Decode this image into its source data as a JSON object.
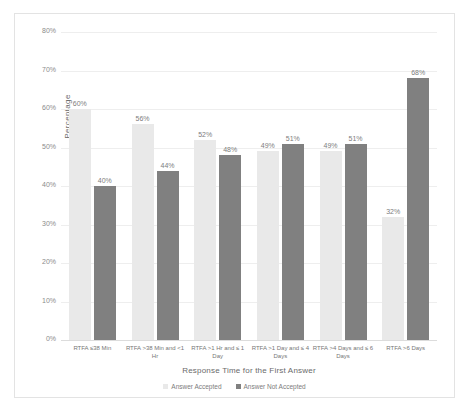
{
  "chart_data": {
    "type": "bar",
    "title": "",
    "xlabel": "Response Time for the First Answer",
    "ylabel": "Percentage",
    "ylim": [
      0,
      80
    ],
    "ytick_labels": [
      "80%",
      "70%",
      "60%",
      "50%",
      "40%",
      "30%",
      "20%",
      "10%",
      "0%"
    ],
    "ytick_values": [
      80,
      70,
      60,
      50,
      40,
      30,
      20,
      10,
      0
    ],
    "grid": true,
    "legend_position": "bottom",
    "categories": [
      "RTFA ≤38 Min",
      "RTFA >38 Min and <1 Hr",
      "RTFA >1 Hr and ≤ 1 Day",
      "RTFA >1 Day and ≤ 4 Days",
      "RTFA >4 Days and ≤ 6 Days",
      "RTFA >6 Days"
    ],
    "series": [
      {
        "name": "Answer Accepted",
        "color": "#e9e9e9",
        "values": [
          60,
          56,
          52,
          49,
          49,
          32
        ],
        "labels": [
          "60%",
          "56%",
          "52%",
          "49%",
          "49%",
          "32%"
        ]
      },
      {
        "name": "Answer Not Accepted",
        "color": "#808080",
        "values": [
          40,
          44,
          48,
          51,
          51,
          68
        ],
        "labels": [
          "40%",
          "44%",
          "48%",
          "51%",
          "51%",
          "68%"
        ]
      }
    ]
  }
}
